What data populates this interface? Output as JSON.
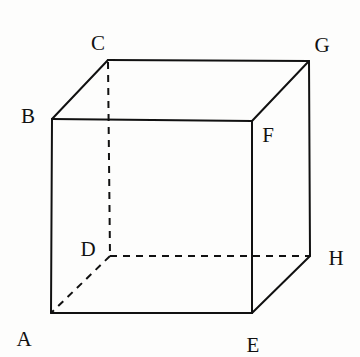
{
  "diagram": {
    "type": "cube",
    "vertices": {
      "A": {
        "label": "A",
        "x": 51,
        "y": 313,
        "label_x": 24,
        "label_y": 339
      },
      "B": {
        "label": "B",
        "x": 52,
        "y": 119,
        "label_x": 28,
        "label_y": 116
      },
      "C": {
        "label": "C",
        "x": 108,
        "y": 60,
        "label_x": 98,
        "label_y": 43
      },
      "D": {
        "label": "D",
        "x": 110,
        "y": 256,
        "label_x": 88,
        "label_y": 249
      },
      "E": {
        "label": "E",
        "x": 252,
        "y": 313,
        "label_x": 253,
        "label_y": 345
      },
      "F": {
        "label": "F",
        "x": 252,
        "y": 121,
        "label_x": 268,
        "label_y": 135
      },
      "G": {
        "label": "G",
        "x": 309,
        "y": 61,
        "label_x": 322,
        "label_y": 45
      },
      "H": {
        "label": "H",
        "x": 310,
        "y": 256,
        "label_x": 336,
        "label_y": 258
      }
    },
    "visible_edges": [
      "AB",
      "AE",
      "BF",
      "EF",
      "BC",
      "CG",
      "FG",
      "GH",
      "EH"
    ],
    "hidden_edges": [
      "AD",
      "CD",
      "DH"
    ]
  }
}
